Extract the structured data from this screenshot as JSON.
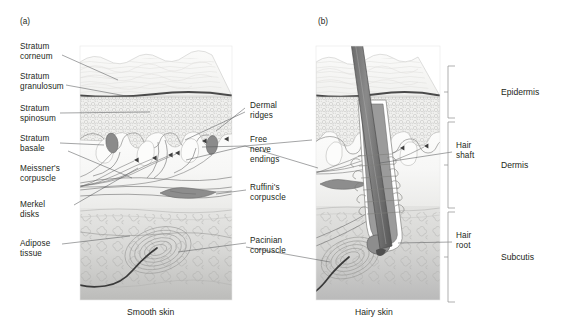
{
  "figure": {
    "type": "anatomical-diagram",
    "panels": [
      {
        "tag": "(a)",
        "caption": "Smooth skin"
      },
      {
        "tag": "(b)",
        "caption": "Hairy skin"
      }
    ]
  },
  "labels_left": [
    {
      "id": "stratum-corneum",
      "text": "Stratum\ncorneum"
    },
    {
      "id": "stratum-granulosum",
      "text": "Stratum\ngranulosum"
    },
    {
      "id": "stratum-spinosum",
      "text": "Stratum\nspinosum"
    },
    {
      "id": "stratum-basale",
      "text": "Stratum\nbasale"
    },
    {
      "id": "meissners-corpuscle",
      "text": "Meissner's\ncorpuscle"
    },
    {
      "id": "merkel-disks",
      "text": "Merkel\ndisks"
    },
    {
      "id": "adipose-tissue",
      "text": "Adipose\ntissue"
    }
  ],
  "labels_center": [
    {
      "id": "dermal-ridges",
      "text": "Dermal\nridges"
    },
    {
      "id": "free-nerve-endings",
      "text": "Free\nnerve\nendings"
    },
    {
      "id": "ruffinis-corpuscle",
      "text": "Ruffini's\ncorpuscle"
    },
    {
      "id": "pacinian-corpuscle",
      "text": "Pacinian\ncorpuscle"
    }
  ],
  "labels_right": [
    {
      "id": "hair-shaft",
      "text": "Hair\nshaft"
    },
    {
      "id": "hair-root",
      "text": "Hair\nroot"
    }
  ],
  "brackets": [
    {
      "id": "epidermis",
      "text": "Epidermis"
    },
    {
      "id": "dermis",
      "text": "Dermis"
    },
    {
      "id": "subcutis",
      "text": "Subcutis"
    }
  ],
  "colors": {
    "text": "#231f20",
    "leader_line": "#58595b",
    "bracket": "#8c8c8c",
    "granulosum_line": "#4a4a4a",
    "corpuscle_fill": "#8b8b8b",
    "hair": "#6e6e6e",
    "epidermis_fill": "#f4f4f2",
    "dermis_fill": "#fbfbfa",
    "subcutis_fill": "#cfcfcf",
    "background": "#ffffff"
  }
}
